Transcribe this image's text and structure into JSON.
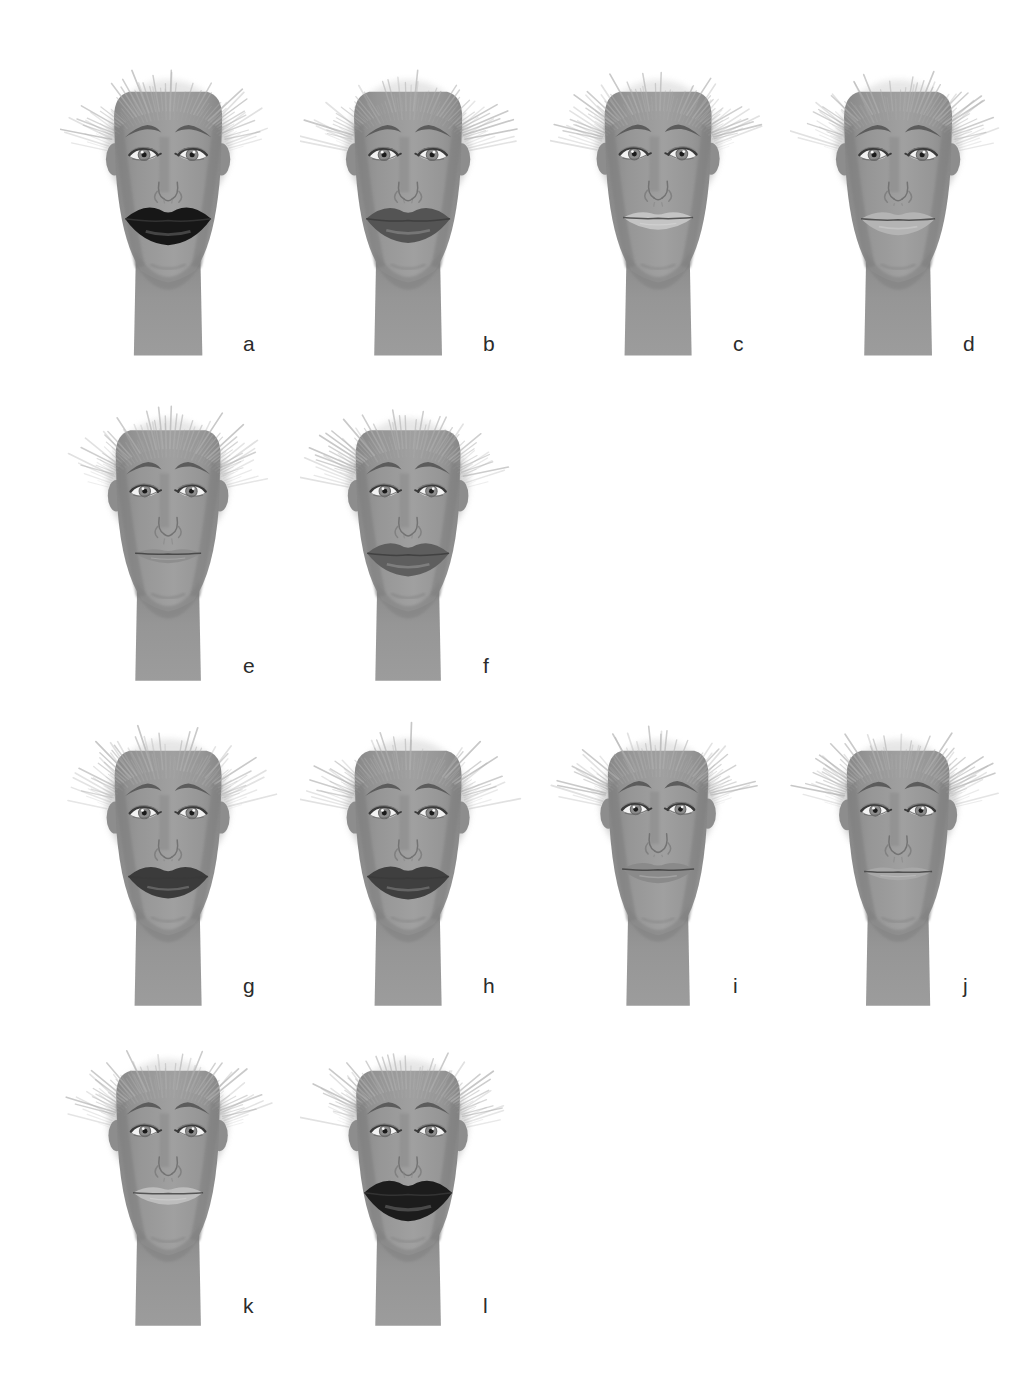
{
  "figure": {
    "type": "illustration-plate",
    "background_color": "#ffffff",
    "label_color": "#2b2b2b",
    "palette": {
      "skin": "#969696",
      "skin_shadow": "#878787",
      "skin_light": "#a0a0a0",
      "hair": "#c9c9c9",
      "hair_dark": "#b0b0b0",
      "brow": "#5c5c5c",
      "eye_white": "#f2f2f2",
      "iris": "#8c8c8c",
      "pupil": "#1a1a1a",
      "lash": "#3a3a3a",
      "outline": "#7a7a7a"
    }
  },
  "rows": [
    {
      "row_index": 1,
      "top": 60,
      "face_keys": [
        "a",
        "b",
        "c",
        "d"
      ]
    },
    {
      "row_index": 2,
      "top": 400,
      "face_keys": [
        "e",
        "f"
      ]
    },
    {
      "row_index": 3,
      "top": 720,
      "face_keys": [
        "g",
        "h",
        "i",
        "j"
      ]
    },
    {
      "row_index": 4,
      "top": 1040,
      "face_keys": [
        "k",
        "l"
      ]
    }
  ],
  "column_lefts": [
    60,
    300,
    550,
    790
  ],
  "faces": [
    {
      "key": "a",
      "label": "a",
      "row": 1,
      "col": 1,
      "left": 60,
      "top": 60,
      "width": 230,
      "height": 300,
      "label_left": 243,
      "label_top": 333,
      "face_width": 1.0,
      "jaw_width": 0.96,
      "lips": {
        "style": "full-dark",
        "color": "#171717",
        "width": 86,
        "upper_height": 17,
        "lower_height": 24,
        "cx": 0,
        "cy": 0
      }
    },
    {
      "key": "b",
      "label": "b",
      "row": 1,
      "col": 2,
      "left": 300,
      "top": 60,
      "width": 230,
      "height": 300,
      "label_left": 483,
      "label_top": 333,
      "face_width": 1.0,
      "jaw_width": 0.95,
      "lips": {
        "style": "full-medium",
        "color": "#545454",
        "width": 84,
        "upper_height": 16,
        "lower_height": 22,
        "cx": 0,
        "cy": 0
      }
    },
    {
      "key": "c",
      "label": "c",
      "row": 1,
      "col": 3,
      "left": 550,
      "top": 60,
      "width": 230,
      "height": 300,
      "label_left": 733,
      "label_top": 333,
      "face_width": 0.99,
      "jaw_width": 0.94,
      "lips": {
        "style": "thin-light",
        "color": "#c4c4c4",
        "width": 70,
        "upper_height": 8,
        "lower_height": 11,
        "cx": 0,
        "cy": 0
      }
    },
    {
      "key": "d",
      "label": "d",
      "row": 1,
      "col": 4,
      "left": 790,
      "top": 60,
      "width": 230,
      "height": 300,
      "label_left": 963,
      "label_top": 333,
      "face_width": 1.0,
      "jaw_width": 0.95,
      "lips": {
        "style": "medium-light",
        "color": "#b4b4b4",
        "width": 74,
        "upper_height": 10,
        "lower_height": 15,
        "cx": 0,
        "cy": 0
      }
    },
    {
      "key": "e",
      "label": "e",
      "row": 2,
      "col": 1,
      "left": 60,
      "top": 400,
      "width": 230,
      "height": 285,
      "label_left": 243,
      "label_top": 655,
      "face_width": 0.97,
      "jaw_width": 0.92,
      "lips": {
        "style": "very-thin",
        "color": "#8e8e8e",
        "width": 66,
        "upper_height": 6,
        "lower_height": 9,
        "cx": 0,
        "cy": 0
      }
    },
    {
      "key": "f",
      "label": "f",
      "row": 2,
      "col": 2,
      "left": 300,
      "top": 400,
      "width": 230,
      "height": 285,
      "label_left": 483,
      "label_top": 655,
      "face_width": 0.97,
      "jaw_width": 0.92,
      "lips": {
        "style": "full-medium",
        "color": "#5e5e5e",
        "width": 82,
        "upper_height": 15,
        "lower_height": 21,
        "cx": 0,
        "cy": 0
      }
    },
    {
      "key": "g",
      "label": "g",
      "row": 3,
      "col": 1,
      "left": 60,
      "top": 720,
      "width": 230,
      "height": 290,
      "label_left": 243,
      "label_top": 975,
      "face_width": 0.99,
      "jaw_width": 0.94,
      "lips": {
        "style": "full-dark",
        "color": "#3b3b3b",
        "width": 80,
        "upper_height": 14,
        "lower_height": 20,
        "cx": 0,
        "cy": 0
      }
    },
    {
      "key": "h",
      "label": "h",
      "row": 3,
      "col": 2,
      "left": 300,
      "top": 720,
      "width": 230,
      "height": 290,
      "label_left": 483,
      "label_top": 975,
      "face_width": 0.99,
      "jaw_width": 0.94,
      "lips": {
        "style": "full-dark",
        "color": "#3f3f3f",
        "width": 82,
        "upper_height": 15,
        "lower_height": 21,
        "cx": 0,
        "cy": 0
      }
    },
    {
      "key": "i",
      "label": "i",
      "row": 3,
      "col": 3,
      "left": 550,
      "top": 720,
      "width": 230,
      "height": 290,
      "label_left": 733,
      "label_top": 975,
      "face_width": 0.93,
      "jaw_width": 0.89,
      "lips": {
        "style": "medium-mid",
        "color": "#8a8a8a",
        "width": 72,
        "upper_height": 9,
        "lower_height": 13,
        "cx": 0,
        "cy": 0
      }
    },
    {
      "key": "j",
      "label": "j",
      "row": 3,
      "col": 4,
      "left": 790,
      "top": 720,
      "width": 230,
      "height": 290,
      "label_left": 963,
      "label_top": 975,
      "face_width": 0.95,
      "jaw_width": 0.9,
      "lips": {
        "style": "very-thin",
        "color": "#a8a8a8",
        "width": 68,
        "upper_height": 6,
        "lower_height": 8,
        "cx": 0,
        "cy": 0
      }
    },
    {
      "key": "k",
      "label": "k",
      "row": 4,
      "col": 1,
      "left": 60,
      "top": 1040,
      "width": 230,
      "height": 290,
      "label_left": 243,
      "label_top": 1295,
      "face_width": 0.96,
      "jaw_width": 0.92,
      "lips": {
        "style": "thin-light",
        "color": "#bdbdbd",
        "width": 70,
        "upper_height": 8,
        "lower_height": 11,
        "cx": 0,
        "cy": 0
      }
    },
    {
      "key": "l",
      "label": "l",
      "row": 4,
      "col": 2,
      "left": 300,
      "top": 1040,
      "width": 230,
      "height": 290,
      "label_left": 483,
      "label_top": 1295,
      "face_width": 0.96,
      "jaw_width": 0.92,
      "lips": {
        "style": "full-dark",
        "color": "#1c1c1c",
        "width": 88,
        "upper_height": 18,
        "lower_height": 26,
        "cx": 0,
        "cy": 0
      }
    }
  ]
}
